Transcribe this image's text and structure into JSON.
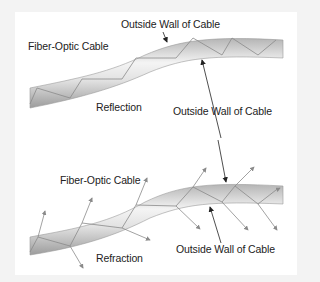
{
  "diagram": {
    "colors": {
      "background": "#f3f3f3",
      "panel": "#ffffff",
      "cable_light": "#f2f2f2",
      "cable_dark": "#a8a8a8",
      "ray": "#888888",
      "text": "#222222"
    },
    "top": {
      "title": "Reflection",
      "labels": {
        "cable": "Fiber-Optic Cable",
        "wall_top": "Outside Wall of Cable",
        "wall_bottom": "Outside Wall of Cable"
      }
    },
    "bottom": {
      "title": "Refraction",
      "labels": {
        "cable": "Fiber-Optic Cable",
        "wall_bottom": "Outside Wall of Cable"
      }
    }
  }
}
